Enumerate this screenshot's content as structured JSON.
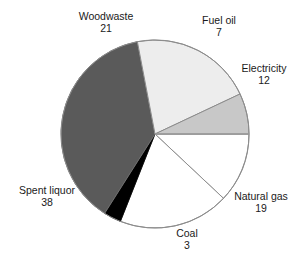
{
  "chart_data": {
    "type": "pie",
    "title": "",
    "subtitle": "",
    "xlabel": "",
    "ylabel": "",
    "grid": false,
    "legend_position": "none",
    "label_format": "name above value",
    "total": 100,
    "units": "percent",
    "start_angle_deg": 0,
    "direction": "clockwise",
    "categories": [
      "Electricity",
      "Natural gas",
      "Coal",
      "Spent liquor",
      "Woodwaste",
      "Fuel oil"
    ],
    "values": [
      12,
      19,
      3,
      38,
      21,
      7
    ],
    "slices": [
      {
        "label": "Electricity",
        "value": 12,
        "color": "#ffffff",
        "start_deg": 0.0,
        "end_deg": 43.2,
        "label_pos": "right-upper"
      },
      {
        "label": "Natural gas",
        "value": 19,
        "color": "#ffffff",
        "start_deg": 43.2,
        "end_deg": 111.6,
        "label_pos": "right-lower"
      },
      {
        "label": "Coal",
        "value": 3,
        "color": "#000000",
        "start_deg": 111.6,
        "end_deg": 122.4,
        "label_pos": "bottom"
      },
      {
        "label": "Spent liquor",
        "value": 38,
        "color": "#5a5a5a",
        "start_deg": 122.4,
        "end_deg": 259.2,
        "label_pos": "left-lower"
      },
      {
        "label": "Woodwaste",
        "value": 21,
        "color": "#ededed",
        "start_deg": 259.2,
        "end_deg": 334.8,
        "label_pos": "top-left"
      },
      {
        "label": "Fuel oil",
        "value": 7,
        "color": "#c8c8c8",
        "start_deg": 334.8,
        "end_deg": 360.0,
        "label_pos": "top-right"
      }
    ]
  },
  "labels": {
    "woodwaste": {
      "name": "Woodwaste",
      "value": "21"
    },
    "fuel_oil": {
      "name": "Fuel oil",
      "value": "7"
    },
    "electricity": {
      "name": "Electricity",
      "value": "12"
    },
    "natural_gas": {
      "name": "Natural gas",
      "value": "19"
    },
    "coal": {
      "name": "Coal",
      "value": "3"
    },
    "spent_liquor": {
      "name": "Spent liquor",
      "value": "38"
    }
  },
  "style": {
    "background": "#ffffff",
    "outline": "#8c8c8c",
    "text": "#1a1a1a",
    "center_x": 155,
    "center_y": 134,
    "radius": 94
  }
}
